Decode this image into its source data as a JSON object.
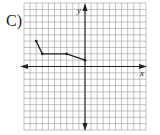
{
  "problem": {
    "label": "C)"
  },
  "chart_data": {
    "type": "line",
    "title": "",
    "xlabel": "x",
    "ylabel": "y",
    "xlim": [
      -10,
      10
    ],
    "ylim": [
      -10,
      10
    ],
    "grid": true,
    "series": [
      {
        "name": "segments",
        "x": [
          -8,
          -7,
          -3,
          0
        ],
        "y": [
          4,
          2,
          2,
          1
        ],
        "markers": true
      }
    ],
    "axis_arrows": {
      "x": [
        "left",
        "right"
      ],
      "y": [
        "up",
        "down"
      ]
    }
  },
  "colors": {
    "grid": "#9a9a9a",
    "axis": "#222222",
    "line": "#222222"
  }
}
